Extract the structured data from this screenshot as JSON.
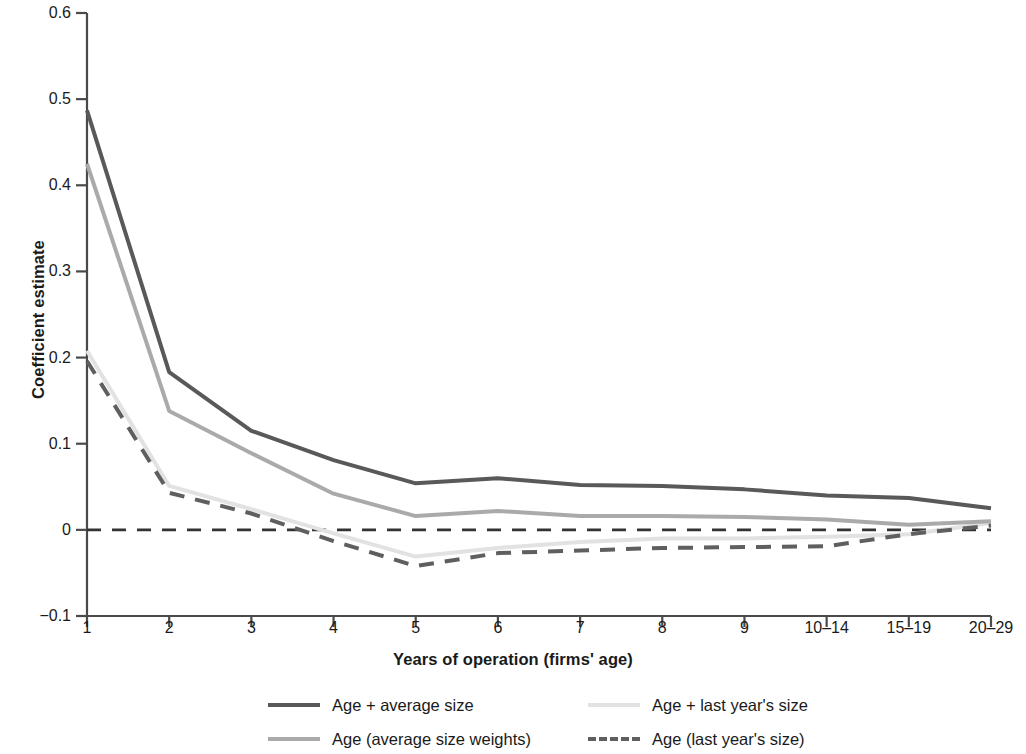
{
  "chart_data": {
    "type": "line",
    "title": "",
    "xlabel": "Years of operation (firms' age)",
    "ylabel": "Coefficient estimate",
    "categories": [
      "1",
      "2",
      "3",
      "4",
      "5",
      "6",
      "7",
      "8",
      "9",
      "10–14",
      "15–19",
      "20–29"
    ],
    "ylim": [
      -0.1,
      0.6
    ],
    "yticks": [
      "0.6",
      "0.5",
      "0.4",
      "0.3",
      "0.2",
      "0.1",
      "0",
      "-0.1"
    ],
    "ytick_values": [
      0.6,
      0.5,
      0.4,
      0.3,
      0.2,
      0.1,
      0,
      -0.1
    ],
    "grid": false,
    "zero_line": true,
    "legend_position": "bottom",
    "series": [
      {
        "name": "Age + average size",
        "color": "#595959",
        "style": "solid",
        "width": 4,
        "values": [
          0.487,
          0.183,
          0.115,
          0.081,
          0.054,
          0.06,
          0.052,
          0.051,
          0.047,
          0.04,
          0.037,
          0.025
        ]
      },
      {
        "name": "Age (average size weights)",
        "color": "#aaaaaa",
        "style": "solid",
        "width": 4,
        "values": [
          0.425,
          0.138,
          0.089,
          0.042,
          0.016,
          0.022,
          0.016,
          0.016,
          0.015,
          0.012,
          0.006,
          0.01
        ]
      },
      {
        "name": "Age + last year's size",
        "color": "#e2e2e2",
        "style": "solid",
        "width": 4,
        "values": [
          0.208,
          0.051,
          0.024,
          -0.004,
          -0.031,
          -0.021,
          -0.014,
          -0.01,
          -0.01,
          -0.008,
          -0.005,
          0.008
        ]
      },
      {
        "name": "Age (last year's size)",
        "color": "#5f5f5f",
        "style": "dashed",
        "width": 4,
        "values": [
          0.196,
          0.043,
          0.019,
          -0.013,
          -0.042,
          -0.027,
          -0.024,
          -0.021,
          -0.02,
          -0.019,
          -0.005,
          0.005
        ]
      }
    ]
  },
  "legend": {
    "items": [
      {
        "label": "Age + average size"
      },
      {
        "label": "Age + last year's size"
      },
      {
        "label": "Age (average size weights)"
      },
      {
        "label": "Age (last year's size)"
      }
    ]
  }
}
